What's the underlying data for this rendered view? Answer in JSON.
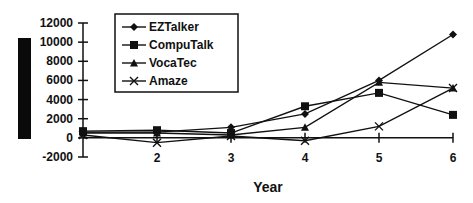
{
  "chart_data": {
    "type": "line",
    "title": "",
    "xlabel": "Year",
    "ylabel": "",
    "x": [
      1,
      2,
      3,
      4,
      5,
      6
    ],
    "x_tick_labels": [
      "2",
      "3",
      "4",
      "5",
      "6"
    ],
    "ylim": [
      -2000,
      12000
    ],
    "y_ticks": [
      -2000,
      0,
      2000,
      4000,
      6000,
      8000,
      10000,
      12000
    ],
    "y_tick_labels": [
      "-2000",
      "0",
      "2000",
      "4000",
      "6000",
      "8000",
      "10000",
      "12000"
    ],
    "grid": false,
    "legend_position": "top-left-inside",
    "series": [
      {
        "name": "EZTalker",
        "marker": "diamond",
        "values": [
          600,
          600,
          1100,
          2500,
          6000,
          10800
        ]
      },
      {
        "name": "CompuTalk",
        "marker": "square",
        "values": [
          700,
          800,
          500,
          3300,
          4700,
          2400
        ]
      },
      {
        "name": "VocaTec",
        "marker": "triangle",
        "values": [
          500,
          500,
          300,
          1100,
          5800,
          5200
        ]
      },
      {
        "name": "Amaze",
        "marker": "x",
        "values": [
          300,
          -500,
          200,
          -300,
          1200,
          5200
        ]
      }
    ]
  },
  "legend": {
    "items": [
      {
        "label": "EZTalker",
        "marker": "diamond"
      },
      {
        "label": "CompuTalk",
        "marker": "square"
      },
      {
        "label": "VocaTec",
        "marker": "triangle"
      },
      {
        "label": "Amaze",
        "marker": "x"
      }
    ]
  },
  "colors": {
    "line": "#111111",
    "background": "#ffffff",
    "side_bar": "#0a0a0a"
  }
}
